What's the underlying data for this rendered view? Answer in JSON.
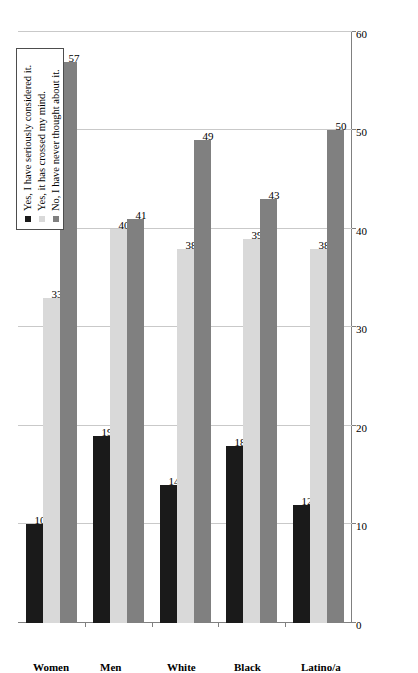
{
  "chart_data": {
    "type": "bar",
    "orientation": "horizontal",
    "title": "",
    "subtitle": "",
    "xlabel": "",
    "ylabel": "",
    "xlim": [
      0,
      60
    ],
    "xticks": [
      0,
      10,
      20,
      30,
      40,
      50,
      60
    ],
    "grid": true,
    "legend_position": "top-left",
    "categories": [
      "Women",
      "Men",
      "White",
      "Black",
      "Latino/a"
    ],
    "series": [
      {
        "name": "Yes, I have seriously considered it.",
        "color": "#1a1a1a",
        "values": [
          10,
          19,
          14,
          18,
          12
        ]
      },
      {
        "name": "Yes, it has crossed my mind.",
        "color": "#d9d9d9",
        "values": [
          33,
          40,
          38,
          39,
          38
        ]
      },
      {
        "name": "No, I have never thought about it.",
        "color": "#808080",
        "values": [
          57,
          41,
          49,
          43,
          50
        ]
      }
    ]
  },
  "legend": {
    "items": [
      {
        "label": "Yes, I have seriously considered it.",
        "swatch": "s0"
      },
      {
        "label": "Yes, it has crossed my mind.",
        "swatch": "s1"
      },
      {
        "label": "No, I have never thought about it.",
        "swatch": "s2"
      }
    ]
  },
  "axis": {
    "tick_labels": [
      "0",
      "10",
      "20",
      "30",
      "40",
      "50",
      "60"
    ],
    "category_labels": [
      "Women",
      "Men",
      "White",
      "Black",
      "Latino/a"
    ]
  }
}
